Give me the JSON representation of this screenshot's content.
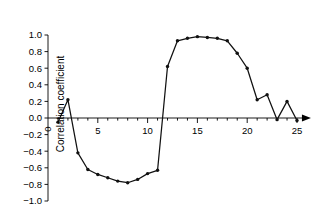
{
  "chart_data": {
    "type": "line",
    "title": "",
    "subtitle": "",
    "xlabel": "",
    "ylabel": "Correlation coefficient",
    "xlim": [
      0,
      25.8
    ],
    "ylim": [
      -1.0,
      1.0
    ],
    "grid": false,
    "legend": null,
    "marker": "filled-circle",
    "line_color": "#111111",
    "axis_color": "#000000",
    "x_ticks": [
      0,
      5,
      10,
      15,
      20,
      25
    ],
    "x_tick_labels": [
      "0",
      "5",
      "10",
      "15",
      "20",
      "25"
    ],
    "x_minor_ticks": [
      1,
      2,
      3,
      4,
      6,
      7,
      8,
      9,
      11,
      12,
      13,
      14,
      16,
      17,
      18,
      19,
      21,
      22,
      23,
      24
    ],
    "y_ticks": [
      -1.0,
      -0.8,
      -0.6,
      -0.4,
      -0.2,
      0.0,
      0.2,
      0.4,
      0.6,
      0.8,
      1.0
    ],
    "y_tick_labels": [
      "-1.0",
      "-0.8",
      "-0.6",
      "-0.4",
      "-0.2",
      "0.0",
      "0.2",
      "0.4",
      "0.6",
      "0.8",
      "1.0"
    ],
    "x_axis_has_arrow": true,
    "x": [
      1,
      2,
      3,
      4,
      5,
      6,
      7,
      8,
      9,
      10,
      11,
      12,
      13,
      14,
      15,
      16,
      17,
      18,
      19,
      20,
      21,
      22,
      23,
      24,
      25
    ],
    "values": [
      -0.05,
      0.22,
      -0.42,
      -0.62,
      -0.68,
      -0.72,
      -0.76,
      -0.78,
      -0.74,
      -0.67,
      -0.63,
      0.62,
      0.93,
      0.96,
      0.98,
      0.97,
      0.96,
      0.93,
      0.78,
      0.6,
      0.22,
      0.28,
      -0.02,
      0.2,
      -0.03
    ],
    "series": [
      {
        "name": "Correlation coefficient",
        "x": [
          1,
          2,
          3,
          4,
          5,
          6,
          7,
          8,
          9,
          10,
          11,
          12,
          13,
          14,
          15,
          16,
          17,
          18,
          19,
          20,
          21,
          22,
          23,
          24,
          25
        ],
        "values": [
          -0.05,
          0.22,
          -0.42,
          -0.62,
          -0.68,
          -0.72,
          -0.76,
          -0.78,
          -0.74,
          -0.67,
          -0.63,
          0.62,
          0.93,
          0.96,
          0.98,
          0.97,
          0.96,
          0.93,
          0.78,
          0.6,
          0.22,
          0.28,
          -0.02,
          0.2,
          -0.03
        ]
      }
    ]
  }
}
